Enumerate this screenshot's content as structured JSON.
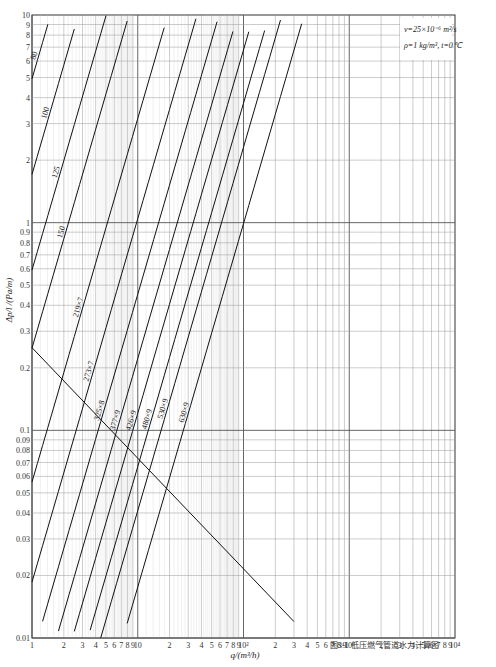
{
  "chart_data": {
    "type": "line",
    "title": "",
    "caption": "图3-1 低压燃气管道水力计算图",
    "xlabel": "q/(m³/h)",
    "ylabel": "Δp/l /(Pa/m)",
    "xscale": "log",
    "yscale": "log",
    "xlim": [
      1,
      10000
    ],
    "ylim": [
      0.01,
      10
    ],
    "grid": true,
    "x_ticks": [
      "1",
      "2",
      "3",
      "4",
      "5",
      "6",
      "7",
      "8",
      "9",
      "10",
      "2",
      "3",
      "4",
      "5",
      "6",
      "7",
      "8",
      "9",
      "10²",
      "2",
      "3",
      "4",
      "5",
      "6",
      "7",
      "8",
      "9",
      "10³",
      "2",
      "3",
      "4",
      "5",
      "6",
      "7",
      "8",
      "9",
      "10⁴"
    ],
    "y_ticks": [
      "10",
      "9",
      "8",
      "7",
      "6",
      "5",
      "4",
      "3",
      "2",
      "1",
      "0.9",
      "0.8",
      "0.7",
      "0.6",
      "0.5",
      "0.4",
      "0.3",
      "0.2",
      "0.1",
      "0.09",
      "0.08",
      "0.07",
      "0.06",
      "0.05",
      "0.04",
      "0.03",
      "0.02",
      "0.01"
    ],
    "annotations": [
      "ν=25×10⁻⁶ m²/s",
      "ρ=1 kg/m³, t=0℃"
    ],
    "series": [
      {
        "name": "20"
      },
      {
        "name": "25"
      },
      {
        "name": "32"
      },
      {
        "name": "40"
      },
      {
        "name": "50"
      },
      {
        "name": "70"
      },
      {
        "name": "80"
      },
      {
        "name": "100"
      },
      {
        "name": "125"
      },
      {
        "name": "150"
      },
      {
        "name": "219×7"
      },
      {
        "name": "273×7"
      },
      {
        "name": "325×8"
      },
      {
        "name": "377×9"
      },
      {
        "name": "426×9"
      },
      {
        "name": "480×9"
      },
      {
        "name": "530×9"
      },
      {
        "name": "630×9"
      }
    ],
    "legend_position": "inline labels on lines"
  }
}
